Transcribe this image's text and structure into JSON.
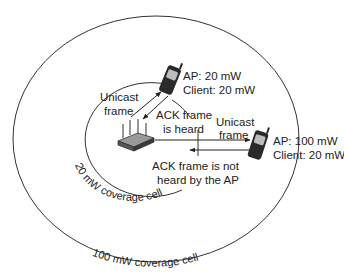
{
  "diagram": {
    "cells": {
      "large": {
        "label": "100 mW coverage cell"
      },
      "small": {
        "label": "20 mW coverage cell"
      }
    },
    "client_near": {
      "line1": "AP: 20 mW",
      "line2": "Client: 20 mW"
    },
    "client_far": {
      "line1": "AP: 100 mW",
      "line2": "Client: 20 mW"
    },
    "near_link": {
      "unicast_line1": "Unicast",
      "unicast_line2": "frame",
      "ack_line1": "ACK frame",
      "ack_line2": "is heard"
    },
    "far_link": {
      "unicast_line1": "Unicast",
      "unicast_line2": "frame",
      "ack_line1": "ACK frame is not",
      "ack_line2": "heard by the AP"
    },
    "icons": {
      "access_point": "access-point-icon",
      "phone": "mobile-phone-icon"
    },
    "colors": {
      "line": "#333333",
      "device_dark": "#2a2a2a",
      "device_grey": "#8a8a8a"
    }
  }
}
